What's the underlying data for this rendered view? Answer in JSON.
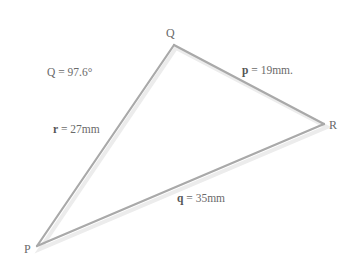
{
  "diagram": {
    "type": "triangle",
    "stroke_color": "#a9a9a9",
    "text_color": "#6a6a6a",
    "vertices": [
      {
        "id": "Q",
        "label": "Q"
      },
      {
        "id": "R",
        "label": "R"
      },
      {
        "id": "P",
        "label": "P"
      }
    ],
    "angle_label": {
      "name": "Q",
      "equals": " = 97.6°"
    },
    "sides": [
      {
        "id": "p",
        "symbol": "p",
        "value": " = 19mm."
      },
      {
        "id": "r",
        "symbol": "r",
        "value": " = 27mm"
      },
      {
        "id": "q",
        "symbol": "q",
        "value": " = 35mm"
      }
    ]
  }
}
